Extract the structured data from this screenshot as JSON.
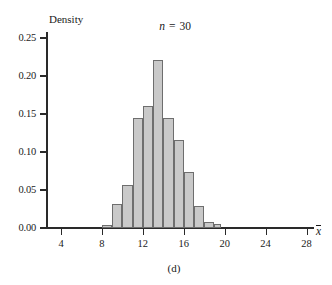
{
  "chart_data": {
    "type": "bar",
    "title_parts": {
      "symbol": "n",
      "equals": "=",
      "value": "30"
    },
    "caption": "(d)",
    "xlabel": "x̄",
    "xlabel_symbol": "x",
    "ylabel": "Density",
    "xlim": [
      2,
      28.5
    ],
    "ylim": [
      0.0,
      0.26
    ],
    "grid": false,
    "legend": null,
    "bin_width": 1,
    "x_ticks": [
      4,
      8,
      12,
      16,
      20,
      24,
      28
    ],
    "x_tick_labels": [
      "4",
      "8",
      "12",
      "16",
      "20",
      "24",
      "28"
    ],
    "y_ticks": [
      0.0,
      0.05,
      0.1,
      0.15,
      0.2,
      0.25
    ],
    "y_tick_labels": [
      "0.00",
      "0.05",
      "0.10",
      "0.15",
      "0.20",
      "0.25"
    ],
    "bar_fill": "#c9c9c9",
    "bar_edge": "#6e6e6e",
    "axis_color": "#2a2a2a",
    "bins": [
      {
        "x0": 8.0,
        "x1": 9.0,
        "value": 0.004
      },
      {
        "x0": 9.0,
        "x1": 10.0,
        "value": 0.032
      },
      {
        "x0": 10.0,
        "x1": 11.0,
        "value": 0.056
      },
      {
        "x0": 11.0,
        "x1": 12.0,
        "value": 0.145
      },
      {
        "x0": 12.0,
        "x1": 13.0,
        "value": 0.16
      },
      {
        "x0": 13.0,
        "x1": 14.0,
        "value": 0.221
      },
      {
        "x0": 14.0,
        "x1": 15.0,
        "value": 0.145
      },
      {
        "x0": 15.0,
        "x1": 16.0,
        "value": 0.116
      },
      {
        "x0": 16.0,
        "x1": 17.0,
        "value": 0.074
      },
      {
        "x0": 17.0,
        "x1": 18.0,
        "value": 0.029
      },
      {
        "x0": 18.0,
        "x1": 19.0,
        "value": 0.008
      },
      {
        "x0": 19.0,
        "x1": 19.6,
        "value": 0.005
      }
    ]
  }
}
